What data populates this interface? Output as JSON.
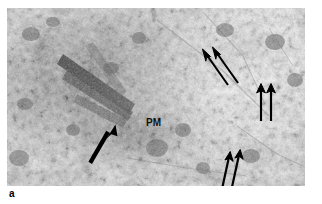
{
  "figure": {
    "panel_letter": "a",
    "modality": "transmission-electron-micrograph",
    "background_color": "#ffffff",
    "plate": {
      "x": 7,
      "y": 8,
      "width": 298,
      "height": 178,
      "tone_min": "#1a1a1a",
      "tone_max": "#fdfdfd",
      "description": "Granular stippled grayscale cytoplasmic texture with a dark diagonal membrane band at center-left"
    },
    "annotations": {
      "text_labels": [
        {
          "name": "pm-label",
          "text": "PM",
          "x": 139,
          "y": 110,
          "color": "#101010"
        }
      ],
      "arrow_color": "#000000",
      "arrow_groups": [
        {
          "name": "membrane-arrow",
          "count": 1,
          "style": "thick-tapered",
          "description": "Single thick arrow pointing up-right toward the plasma membrane band",
          "arrows": [
            {
              "tail_x": 85,
              "tail_y": 155,
              "tip_x": 106,
              "tip_y": 120,
              "width": 4.2
            }
          ]
        },
        {
          "name": "upper-right-arrow-pair",
          "count": 2,
          "style": "slim-barbed",
          "description": "Two parallel arrows pointing up and to the left",
          "arrows": [
            {
              "tail_x": 221,
              "tail_y": 77,
              "tip_x": 196,
              "tip_y": 42,
              "width": 2.1
            },
            {
              "tail_x": 231,
              "tail_y": 75,
              "tip_x": 206,
              "tip_y": 40,
              "width": 2.1
            }
          ]
        },
        {
          "name": "right-vertical-arrow-pair",
          "count": 2,
          "style": "slim-barbed",
          "description": "Two vertical arrows pointing straight up",
          "arrows": [
            {
              "tail_x": 254,
              "tail_y": 112,
              "tip_x": 254,
              "tip_y": 77,
              "width": 2.1
            },
            {
              "tail_x": 264,
              "tail_y": 112,
              "tip_x": 264,
              "tip_y": 77,
              "width": 2.1
            }
          ]
        },
        {
          "name": "lower-right-arrow-pair",
          "count": 2,
          "style": "slim-barbed",
          "description": "Two slightly tilted arrows pointing up and slightly right",
          "arrows": [
            {
              "tail_x": 215,
              "tail_y": 180,
              "tip_x": 223,
              "tip_y": 144,
              "width": 2.1
            },
            {
              "tail_x": 225,
              "tail_y": 178,
              "tip_x": 233,
              "tip_y": 142,
              "width": 2.1
            }
          ]
        }
      ]
    }
  }
}
